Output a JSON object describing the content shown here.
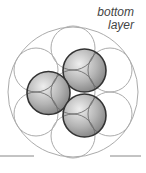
{
  "label": {
    "line1": "bottom",
    "line2": "layer"
  },
  "colors": {
    "thin_line": "#ababab",
    "sphere_outline": "#333333",
    "sphere_light": "#eeeeee",
    "sphere_mid": "#b4b4b4",
    "sphere_dark": "#7a7a7a",
    "inner_arc": "#6a6a6a",
    "ground_line": "#888888"
  },
  "diagram": {
    "outer_circle": {
      "cx": 73,
      "cy": 92,
      "r": 65
    },
    "bottom_layer_radius": 22,
    "bottom_layer_circles": [
      {
        "cx": 73,
        "cy": 92
      },
      {
        "cx": 73,
        "cy": 48
      },
      {
        "cx": 73,
        "cy": 136
      },
      {
        "cx": 36,
        "cy": 70
      },
      {
        "cx": 36,
        "cy": 114
      },
      {
        "cx": 110,
        "cy": 70
      },
      {
        "cx": 110,
        "cy": 114
      }
    ],
    "sphere_radius": 21.5,
    "top_spheres": [
      {
        "cx": 84.5,
        "cy": 70.5
      },
      {
        "cx": 48.5,
        "cy": 93
      },
      {
        "cx": 84.5,
        "cy": 115.5
      }
    ],
    "ground_lines": [
      {
        "x1": 0,
        "x2": 34,
        "y": 156
      },
      {
        "x1": 110,
        "x2": 141,
        "y": 156
      }
    ]
  }
}
